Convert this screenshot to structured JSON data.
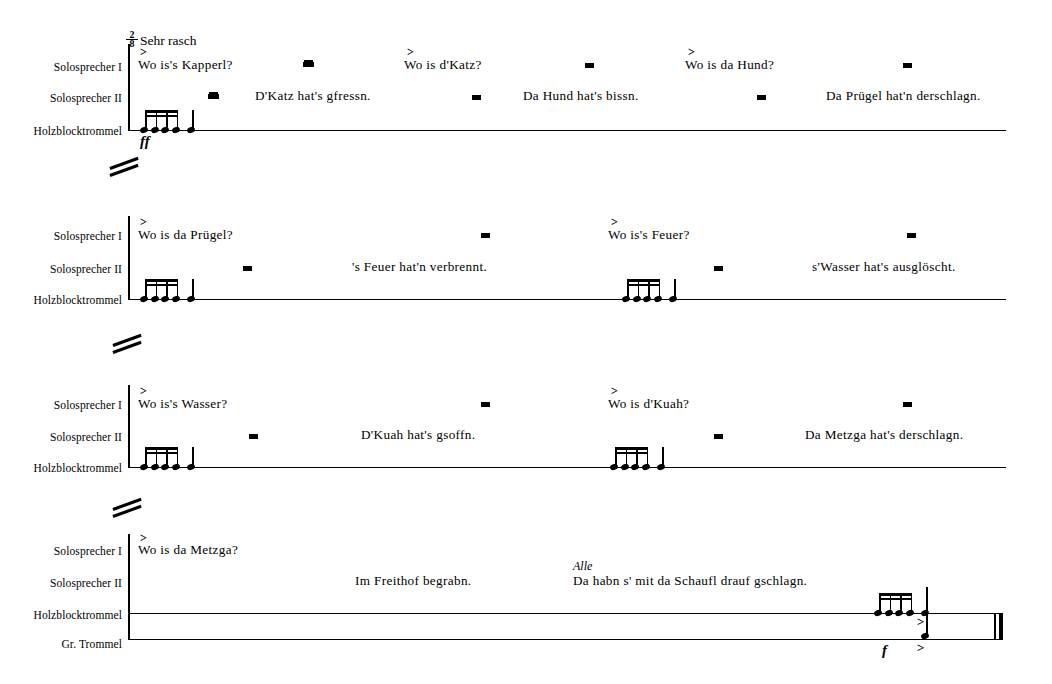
{
  "score": {
    "tempo": "Sehr rasch",
    "time_signature": {
      "numerator": "2",
      "denominator": "8"
    },
    "labels": {
      "speaker1": "Solosprecher I",
      "speaker2": "Solosprecher II",
      "woodblock": "Holzblocktrommel",
      "bassdrum": "Gr. Trommel"
    },
    "dynamics": {
      "ff": "ff",
      "f": "f"
    },
    "accent_mark": ">",
    "alle": "Alle",
    "systems": [
      {
        "speaker1": [
          "Wo is's Kapperl?",
          "Wo is d'Katz?",
          "Wo is da Hund?"
        ],
        "speaker2": [
          "D'Katz hat's gfressn.",
          "Da Hund hat's bissn.",
          "Da Prügel hat'n derschlagn."
        ]
      },
      {
        "speaker1": [
          "Wo is da Prügel?",
          "Wo is's Feuer?"
        ],
        "speaker2": [
          "'s Feuer hat'n verbrennt.",
          "s'Wasser hat's ausglöscht."
        ]
      },
      {
        "speaker1": [
          "Wo is's Wasser?",
          "Wo is d'Kuah?"
        ],
        "speaker2": [
          "D'Kuah hat's gsoffn.",
          "Da Metzga hat's derschlagn."
        ]
      },
      {
        "speaker1": [
          "Wo is da Metzga?"
        ],
        "speaker2": [
          "Im Freithof begrabn.",
          "Da habn s' mit da Schaufl drauf gschlagn."
        ]
      }
    ]
  }
}
